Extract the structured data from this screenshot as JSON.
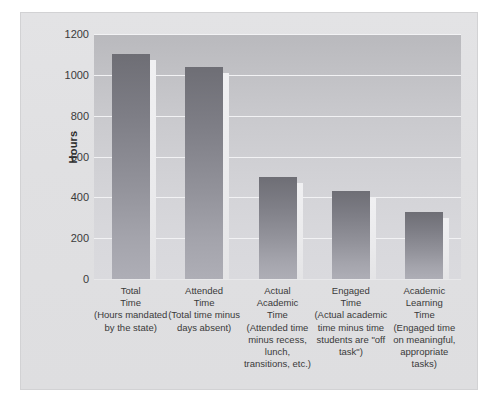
{
  "chart_data": {
    "type": "bar",
    "title": "",
    "xlabel": "",
    "ylabel": "Hours",
    "ylim": [
      0,
      1200
    ],
    "ytick_step": 200,
    "grid": true,
    "legend": "none",
    "categories": [
      "Total Time",
      "Attended Time",
      "Actual Academic Time",
      "Engaged Time",
      "Academic Learning Time"
    ],
    "values": [
      1100,
      1040,
      500,
      430,
      330
    ],
    "yticks": [
      "1200",
      "1000",
      "800",
      "600",
      "400",
      "200",
      "0"
    ],
    "bars": [
      {
        "name": "total-time",
        "value": 1100,
        "label_main": "Total\nTime",
        "label_line1": "Total",
        "label_line2": "Time",
        "label_sub": "(Hours mandated by the state)"
      },
      {
        "name": "attended-time",
        "value": 1040,
        "label_line1": "Attended",
        "label_line2": "Time",
        "label_sub": "(Total time minus days absent)"
      },
      {
        "name": "actual-academic-time",
        "value": 500,
        "label_line1": "Actual",
        "label_line2": "Academic",
        "label_line3": "Time",
        "label_sub": "(Attended time minus recess, lunch, transitions, etc.)"
      },
      {
        "name": "engaged-time",
        "value": 430,
        "label_line1": "Engaged",
        "label_line2": "Time",
        "label_sub": "(Actual academic time minus time students are \"off task\")"
      },
      {
        "name": "academic-learning-time",
        "value": 330,
        "label_line1": "Academic",
        "label_line2": "Learning",
        "label_line3": "Time",
        "label_sub": "(Engaged time on meaningful, appropriate tasks)"
      }
    ],
    "colors": {
      "bar_top": "#6e6e75",
      "bar_bottom": "#aeaeb6",
      "plot_bg_top": "#b9b9bd",
      "plot_bg_bottom": "#dadade",
      "figure_bg": "#e1e1e3",
      "gridline": "#f2f2f4",
      "text": "#3a3a3a"
    }
  },
  "axis": {
    "y_title": "Hours"
  }
}
